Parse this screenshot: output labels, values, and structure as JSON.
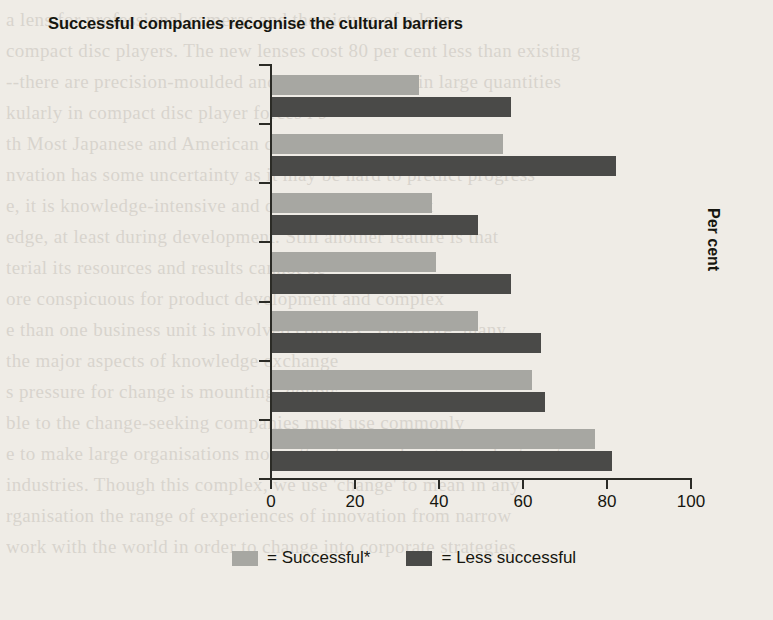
{
  "chart_data": {
    "type": "bar",
    "orientation": "horizontal",
    "title": "Successful companies recognise the cultural barriers",
    "xlabel": "",
    "ylabel": "Per cent",
    "xlim": [
      0,
      100
    ],
    "xticks": [
      "0",
      "20",
      "40",
      "60",
      "80",
      "100"
    ],
    "grid": false,
    "legend_position": "bottom",
    "categories": [
      "Top management as sponsor",
      "Innovative middle management",
      "Incentives for innovation",
      "Committed personnel",
      "Clear vision",
      "Unconventional thinking",
      "Openness towards innovation"
    ],
    "category_lines": [
      [
        "Top management as",
        "sponsor"
      ],
      [
        "Innovative middle",
        "management"
      ],
      [
        "Incentives for innovation"
      ],
      [
        "Committed personnel"
      ],
      [
        "Clear vision"
      ],
      [
        "Unconventional thinking"
      ],
      [
        "Openness towards",
        "innovation"
      ]
    ],
    "series": [
      {
        "name": "= Successful*",
        "key": "successful",
        "color": "#a7a7a2",
        "values": [
          35,
          55,
          38,
          39,
          49,
          62,
          77
        ]
      },
      {
        "name": "= Less successful",
        "key": "less_successful",
        "color": "#4a4a48",
        "values": [
          57,
          82,
          49,
          57,
          64,
          65,
          81
        ]
      }
    ]
  },
  "bleed_text": [
    "a lens for professional cameras and the  picture  of a lens",
    "compact disc players.  The new lenses cost 80 per cent less than existing",
    "--there are precision-moulded and can be produced in large quantities",
    "kularly in compact disc player forces l 9",
    "th Most Japanese and American companies admit",
    "nvation has some uncertainty as it may be hard to predict progress",
    "e, it is knowledge-intensive and difficult to document",
    "edge, at least during development. Still another feature is that",
    "terial  its resources and results cannot be",
    "ore conspicuous for product development and complex",
    "e than one business unit is involved complex. Therefore, many",
    "the major aspects of knowledge exchange",
    "s pressure for change is mounting, doubts",
    "ble to the change-seeking companies must use commonly",
    "e to make large organisations more attractive in changing and interest",
    "industries. Though this complex, we use 'change' to mean in any",
    "rganisation the range of experiences of innovation from narrow",
    "work with the world in order to change into corporate strategies"
  ]
}
